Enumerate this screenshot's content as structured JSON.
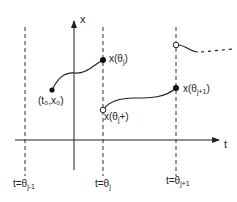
{
  "axes": {
    "x_label": "x",
    "t_label": "t"
  },
  "time_markers": [
    {
      "id": "theta-j-minus-1",
      "label_prefix": "t=θ",
      "sub": "j-1"
    },
    {
      "id": "theta-j",
      "label_prefix": "t=θ",
      "sub": "j"
    },
    {
      "id": "theta-j-plus-1",
      "label_prefix": "t=θ",
      "sub": "j+1"
    }
  ],
  "points": {
    "start": {
      "label": "(t₀,x₀)",
      "open": false
    },
    "x_theta_j": {
      "label_prefix": "x(θ",
      "sub": "j",
      "label_suffix": ")",
      "open": false
    },
    "x_theta_j_plus": {
      "label_prefix": "x(θ",
      "sub": "j",
      "label_suffix": "+)",
      "open": true
    },
    "x_theta_j_plus_1": {
      "label_prefix": "x(θ",
      "sub": "j+1",
      "label_suffix": ")",
      "open": false
    },
    "next_start": {
      "open": true
    }
  },
  "colors": {
    "line": "#222222",
    "background": "#ffffff"
  }
}
